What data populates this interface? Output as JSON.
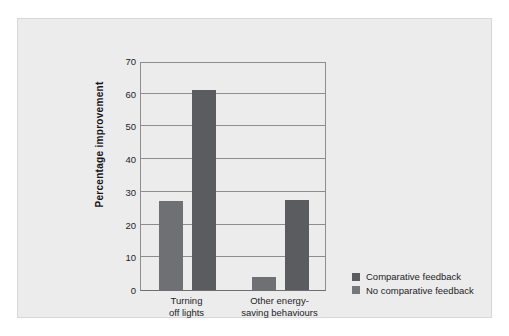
{
  "chart_data": {
    "type": "bar",
    "title": "",
    "subtitle": "",
    "xlabel": "",
    "ylabel": "Percentage  improvement",
    "ylim": [
      0,
      70
    ],
    "yticks": [
      0,
      10,
      20,
      30,
      40,
      50,
      60,
      70
    ],
    "ytick_labels": [
      "0",
      "10",
      "20",
      "30",
      "40",
      "50",
      "60",
      "70"
    ],
    "grid": "horizontal",
    "legend_position": "right",
    "categories": [
      "Turning off lights",
      "Other energy-saving behaviours"
    ],
    "category_lines": [
      [
        "Turning",
        "off lights"
      ],
      [
        "Other energy-",
        "saving behaviours"
      ]
    ],
    "series": [
      {
        "name": "Comparative feedback",
        "color": "#6f7073",
        "values": [
          27.3,
          4.0
        ]
      },
      {
        "name": "No comparative feedback",
        "color": "#5b5c5f",
        "values": [
          61.0,
          27.5
        ]
      }
    ]
  },
  "legend": {
    "items": [
      {
        "label": "Comparative feedback",
        "color": "#5b5c5f"
      },
      {
        "label": "No comparative feedback",
        "color": "#76777a"
      }
    ]
  },
  "colors": {
    "frame_background": "#ececed",
    "plot_background": "#ececec",
    "gridline": "#8d8d8f",
    "axis": "#6e6e70",
    "text": "#1d1d1f"
  }
}
